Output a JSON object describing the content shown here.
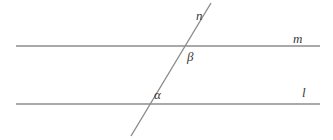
{
  "diagram": {
    "background_color": "#ffffff",
    "line_color": "#8c8c8c",
    "label_color": "#3a3a3a",
    "stroke_width": 1.4,
    "lines": [
      {
        "id": "line-m",
        "label": "m",
        "kind": "parallel-line",
        "x1": 16,
        "y1": 46,
        "x2": 320,
        "y2": 46
      },
      {
        "id": "line-l",
        "label": "l",
        "kind": "parallel-line",
        "x1": 16,
        "y1": 104,
        "x2": 320,
        "y2": 104
      },
      {
        "id": "line-n",
        "label": "n",
        "kind": "transversal",
        "x1": 211,
        "y1": 3,
        "x2": 131,
        "y2": 136
      }
    ],
    "intersections": [
      {
        "id": "intersection-n-m",
        "x": 186,
        "y": 46,
        "lines": [
          "n",
          "m"
        ]
      },
      {
        "id": "intersection-n-l",
        "x": 148,
        "y": 104,
        "lines": [
          "n",
          "l"
        ]
      }
    ],
    "angles": [
      {
        "id": "angle-beta",
        "label": "β",
        "at": "intersection-n-m",
        "position": "below-right",
        "x": 187,
        "y": 50
      },
      {
        "id": "angle-alpha",
        "label": "α",
        "at": "intersection-n-l",
        "position": "above-right",
        "x": 154,
        "y": 88
      }
    ],
    "line_labels": [
      {
        "id": "label-n",
        "text": "n",
        "x": 196,
        "y": 9
      },
      {
        "id": "label-m",
        "text": "m",
        "x": 293,
        "y": 32
      },
      {
        "id": "label-l",
        "text": "l",
        "x": 302,
        "y": 86
      }
    ]
  }
}
